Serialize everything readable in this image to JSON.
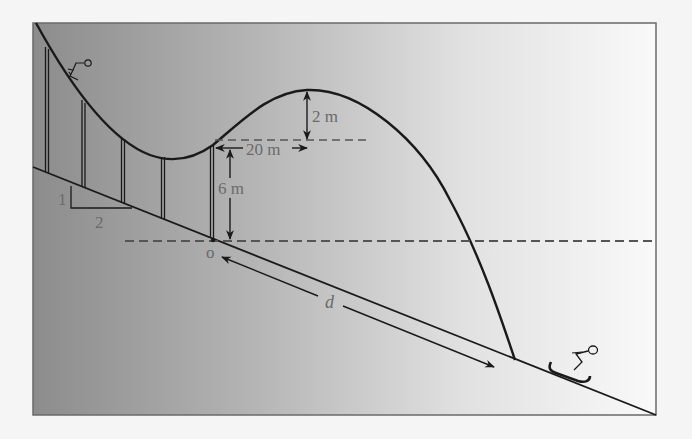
{
  "diagram": {
    "type": "ski-jump-physics-diagram",
    "labels": {
      "height_above_takeoff": "2 m",
      "horizontal_to_peak": "20 m",
      "takeoff_height": "6 m",
      "origin": "o",
      "distance": "d",
      "slope_rise": "1",
      "slope_run": "2"
    },
    "colors": {
      "line": "#1a1a1a",
      "label": "#6a6a6a",
      "dashed": "#555555",
      "gradient_dark": "#8c8c8c",
      "gradient_light": "#f7f7f7"
    },
    "figures": [
      "skier-on-ramp-icon",
      "skier-landing-icon"
    ]
  }
}
